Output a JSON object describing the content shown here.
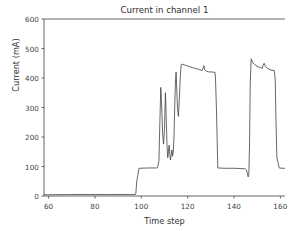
{
  "chart_data": {
    "type": "line",
    "title": "Current in channel 1",
    "xlabel": "Time step",
    "ylabel": "Current (mA)",
    "xlim": [
      58,
      162
    ],
    "ylim": [
      0,
      600
    ],
    "xticks": [
      60,
      80,
      100,
      120,
      140,
      160
    ],
    "yticks": [
      0,
      100,
      200,
      300,
      400,
      500,
      600
    ],
    "xtick_labels": [
      "60",
      "80",
      "100",
      "120",
      "140",
      "160"
    ],
    "ytick_labels": [
      "0",
      "100",
      "200",
      "300",
      "400",
      "500",
      "600"
    ],
    "grid": false,
    "legend": null,
    "line_color": "#404040",
    "line_width": 0.8,
    "series": [
      {
        "name": "Current in channel 1",
        "x": [
          58,
          70,
          85,
          95,
          97.2,
          97.6,
          98.0,
          99.0,
          103,
          106.5,
          107.0,
          107.6,
          108.0,
          108.4,
          108.8,
          109.2,
          109.6,
          110.0,
          110.4,
          110.8,
          111.1,
          111.4,
          111.7,
          112.0,
          112.3,
          112.6,
          112.9,
          113.2,
          113.5,
          113.8,
          114.1,
          114.4,
          114.7,
          115.0,
          115.3,
          115.6,
          116.0,
          116.4,
          116.8,
          117.2,
          117.6,
          118.0,
          119.0,
          121.0,
          123.0,
          125.0,
          126.2,
          126.6,
          127.0,
          127.4,
          128.0,
          129.0,
          131.0,
          131.8,
          132.0,
          132.4,
          133.0,
          136.0,
          140.0,
          143.0,
          144.8,
          145.4,
          145.8,
          146.1,
          146.4,
          146.7,
          147.0,
          147.4,
          148.0,
          149.5,
          151.0,
          152.2,
          152.6,
          153.0,
          153.5,
          154.5,
          156.0,
          157.4,
          157.8,
          158.1,
          158.5,
          159.5,
          161.0,
          162.0
        ],
        "y": [
          4,
          5,
          5,
          5,
          5,
          6,
          48,
          94,
          95,
          95,
          96,
          120,
          250,
          368,
          300,
          210,
          176,
          230,
          350,
          250,
          168,
          130,
          150,
          172,
          140,
          122,
          140,
          156,
          135,
          152,
          200,
          300,
          380,
          420,
          360,
          300,
          270,
          330,
          400,
          445,
          447,
          446,
          443,
          438,
          433,
          429,
          425,
          432,
          442,
          428,
          423,
          421,
          420,
          419,
          400,
          300,
          95,
          94,
          94,
          93,
          92,
          88,
          75,
          65,
          72,
          180,
          380,
          465,
          452,
          442,
          436,
          433,
          444,
          450,
          440,
          432,
          427,
          425,
          390,
          260,
          130,
          95,
          94,
          94
        ]
      }
    ]
  },
  "axes": {
    "title": "Current in channel 1",
    "xlabel": "Time step",
    "ylabel": "Current (mA)"
  }
}
